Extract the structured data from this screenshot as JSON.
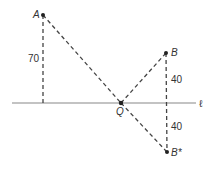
{
  "diagram": {
    "type": "reflection-geometry",
    "line": {
      "label": "ℓ",
      "x1": 12,
      "x2": 196,
      "y": 103
    },
    "points": {
      "A": {
        "label": "A",
        "x": 43,
        "y": 15
      },
      "B": {
        "label": "B",
        "x": 166,
        "y": 53
      },
      "Q": {
        "label": "Q",
        "x": 121,
        "y": 103
      },
      "Bstar": {
        "label": "B*",
        "x": 167,
        "y": 152
      }
    },
    "distances": {
      "A_to_line": "70",
      "B_to_line": "40",
      "Bstar_to_line": "40"
    },
    "colors": {
      "line": "#888888",
      "dash": "#444444",
      "point": "#222222",
      "text": "#333333"
    }
  }
}
